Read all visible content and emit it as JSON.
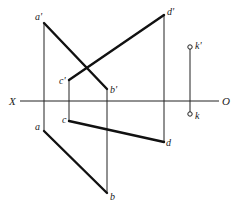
{
  "diagram": {
    "type": "orthographic-projection",
    "axis": {
      "left_label": "X",
      "right_label": "O"
    },
    "points": {
      "a_front": "a'",
      "b_front": "b'",
      "c_front": "c'",
      "d_front": "d'",
      "k_front": "k'",
      "a_top": "a",
      "b_top": "b",
      "c_top": "c",
      "d_top": "d",
      "k_top": "k"
    },
    "lines": [
      {
        "name": "AB",
        "front": "a'b'",
        "top": "ab"
      },
      {
        "name": "CD",
        "front": "c'd'",
        "top": "cd"
      }
    ],
    "isolated_point": "K"
  }
}
